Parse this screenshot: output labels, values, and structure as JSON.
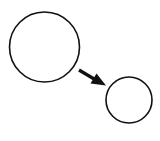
{
  "diagram": {
    "background": "#ffffff",
    "stroke_color": "#111111",
    "nodes": [
      {
        "id": "large-circle",
        "shape": "circle",
        "cx": 44.5,
        "cy": 47,
        "r": 35
      },
      {
        "id": "small-circle",
        "shape": "circle",
        "cx": 129,
        "cy": 100,
        "r": 23
      }
    ],
    "edges": [
      {
        "from": "large-circle",
        "to": "small-circle",
        "type": "arrow",
        "x1": 79,
        "y1": 70,
        "x2": 106,
        "y2": 85
      }
    ]
  }
}
